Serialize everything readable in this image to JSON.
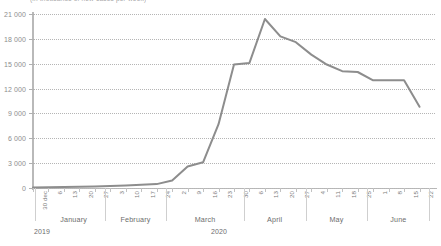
{
  "chart_title": "(in thousands of new cases per week)",
  "axis": {
    "y_labels": [
      "0",
      "3 000",
      "6 000",
      "9 000",
      "12 000",
      "15 000",
      "18 000",
      "21 000"
    ],
    "y_values": [
      0,
      3000,
      6000,
      9000,
      12000,
      15000,
      18000,
      21000
    ],
    "y_min": 0,
    "y_max": 21000,
    "line_color": "#8d8d8d",
    "grid_color": "#b5b5b5",
    "axis_color": "#b9b9b9"
  },
  "months": [
    {
      "label": "January",
      "ticks": 4
    },
    {
      "label": "February",
      "ticks": 4
    },
    {
      "label": "March",
      "ticks": 5
    },
    {
      "label": "April",
      "ticks": 4
    },
    {
      "label": "May",
      "ticks": 4
    },
    {
      "label": "June",
      "ticks": 4
    }
  ],
  "years": [
    {
      "label": "2019"
    },
    {
      "label": "2020"
    }
  ],
  "chart_data": {
    "type": "line",
    "title": "(in thousands of new cases per week)",
    "xlabel": "",
    "ylabel": "",
    "ylim": [
      0,
      21000
    ],
    "grid": true,
    "legend": "none",
    "x": [
      "30 dec",
      "6",
      "13",
      "20",
      "27",
      "3",
      "10",
      "17",
      "24",
      "2",
      "9",
      "16",
      "23",
      "30",
      "6",
      "13",
      "20",
      "27",
      "4",
      "11",
      "18",
      "25",
      "1",
      "8",
      "15",
      "22"
    ],
    "x_month": [
      "December 2019",
      "January",
      "January",
      "January",
      "January",
      "February",
      "February",
      "February",
      "February",
      "March",
      "March",
      "March",
      "March",
      "March",
      "April",
      "April",
      "April",
      "April",
      "May",
      "May",
      "May",
      "May",
      "June",
      "June",
      "June",
      "June"
    ],
    "values": [
      60,
      90,
      110,
      140,
      180,
      230,
      300,
      380,
      470,
      900,
      2600,
      3100,
      7700,
      14900,
      15100,
      20400,
      18300,
      17600,
      16100,
      14900,
      14100,
      14000,
      13000,
      13000,
      13000,
      9800
    ],
    "categories": [
      "30 dec",
      "6",
      "13",
      "20",
      "27",
      "3",
      "10",
      "17",
      "24",
      "2",
      "9",
      "16",
      "23",
      "30",
      "6",
      "13",
      "20",
      "27",
      "4",
      "11",
      "18",
      "25",
      "1",
      "8",
      "15",
      "22"
    ],
    "peak": {
      "x": "13 April",
      "value": 20400
    },
    "end": {
      "x": "22 June",
      "value": 9800
    }
  }
}
